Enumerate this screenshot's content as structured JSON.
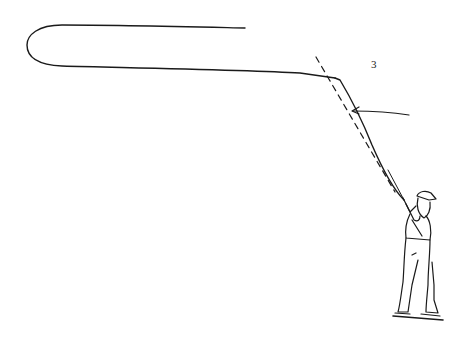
{
  "illustration": {
    "subject": "fly fisherman casting, forward cast with line loop",
    "step_number": "3",
    "colors": {
      "ink": "#1a1a1a",
      "background": "#ffffff"
    }
  }
}
